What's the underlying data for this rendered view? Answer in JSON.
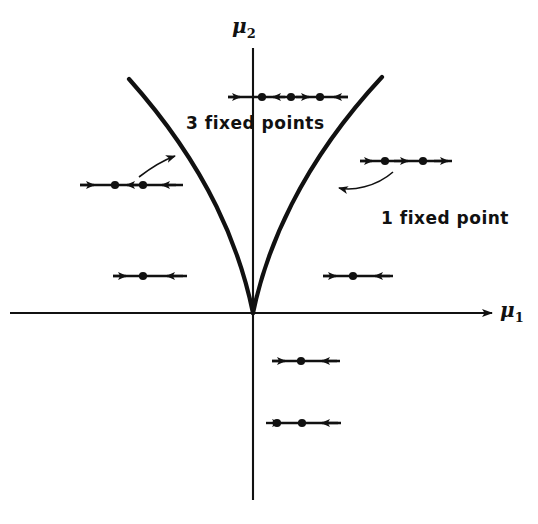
{
  "figure": {
    "background_color": "#ffffff",
    "ink_color": "#111111",
    "width": 538,
    "height": 524
  },
  "axes": {
    "origin": {
      "x": 253,
      "y": 313
    },
    "horizontal": {
      "name": "mu1-axis",
      "label": "μ",
      "subscript": "1",
      "x_start": 10,
      "x_end": 498,
      "y": 313,
      "arrow_end": "right"
    },
    "vertical": {
      "name": "mu2-axis",
      "label": "μ",
      "subscript": "2",
      "y_start": 48,
      "y_end": 500,
      "x": 253,
      "arrow_end": "none"
    }
  },
  "region_labels": [
    {
      "id": "three-fixed-points",
      "text": "3 fixed points",
      "x": 186,
      "y": 113
    },
    {
      "id": "one-fixed-point",
      "text": "1 fixed point",
      "x": 381,
      "y": 208
    }
  ],
  "cusp_curves": [
    {
      "id": "cusp-left-branch",
      "description": "Left branch of the cusp, tangent to the mu2 axis at the origin and rising to the upper left",
      "path": "M 253 313 C 240 250 210 170 129 79"
    },
    {
      "id": "cusp-right-branch",
      "description": "Right branch of the cusp, tangent to the mu2 axis at the origin and rising to the upper right",
      "path": "M 253 313 C 266 250 300 165 382 77"
    }
  ],
  "phase_lines": [
    {
      "id": "phase-line-top-three",
      "region": "inside cusp, three fixed points",
      "x_start": 228,
      "x_end": 348,
      "y": 97,
      "fixed_points": [
        262,
        291,
        320
      ],
      "flow_arrows": [
        {
          "x": 236,
          "direction": "right"
        },
        {
          "x": 277,
          "direction": "left"
        },
        {
          "x": 305,
          "direction": "right"
        },
        {
          "x": 338,
          "direction": "left"
        }
      ],
      "fixed_point_count": 3
    },
    {
      "id": "phase-line-left-three",
      "region": "inside cusp left, three fixed points",
      "x_start": 80,
      "x_end": 183,
      "y": 185,
      "fixed_points": [
        115,
        143
      ],
      "flow_arrows": [
        {
          "x": 92,
          "direction": "right"
        },
        {
          "x": 130,
          "direction": "left"
        },
        {
          "x": 164,
          "direction": "left"
        }
      ],
      "fixed_point_count": 2
    },
    {
      "id": "phase-line-right-one",
      "region": "outside cusp right, one fixed point",
      "x_start": 360,
      "x_end": 452,
      "y": 161,
      "fixed_points": [
        385,
        423
      ],
      "flow_arrows": [
        {
          "x": 368,
          "direction": "right"
        },
        {
          "x": 404,
          "direction": "right"
        },
        {
          "x": 444,
          "direction": "right"
        }
      ],
      "fixed_point_count": 2
    },
    {
      "id": "phase-line-left-one",
      "region": "outside cusp left, one fixed point",
      "x_start": 113,
      "x_end": 187,
      "y": 276,
      "fixed_points": [
        143
      ],
      "flow_arrows": [
        {
          "x": 122,
          "direction": "right"
        },
        {
          "x": 170,
          "direction": "left"
        }
      ],
      "fixed_point_count": 1
    },
    {
      "id": "phase-line-right-one-lower",
      "region": "outside cusp right lower, one fixed point",
      "x_start": 323,
      "x_end": 393,
      "y": 276,
      "fixed_points": [
        353
      ],
      "flow_arrows": [
        {
          "x": 332,
          "direction": "right"
        },
        {
          "x": 378,
          "direction": "left"
        }
      ],
      "fixed_point_count": 1
    },
    {
      "id": "phase-line-below-axis-upper",
      "region": "below mu1 axis, one fixed point",
      "x_start": 272,
      "x_end": 340,
      "y": 361,
      "fixed_points": [
        301
      ],
      "flow_arrows": [
        {
          "x": 281,
          "direction": "right"
        },
        {
          "x": 328,
          "direction": "left"
        }
      ],
      "fixed_point_count": 1
    },
    {
      "id": "phase-line-below-axis-lower",
      "region": "below mu1 axis lower, one fixed point",
      "x_start": 275,
      "x_end": 341,
      "y": 423,
      "fixed_points": [
        277,
        302
      ],
      "flow_arrows": [
        {
          "x": 330,
          "direction": "left"
        }
      ],
      "fixed_point_count": 2
    }
  ],
  "pointers": [
    {
      "id": "pointer-left",
      "description": "Curved arrow from left phase line to left cusp branch",
      "path": "M 143 178 C 155 168 166 161 177 157",
      "arrow_at": {
        "x": 179,
        "y": 156,
        "angle": -25
      }
    },
    {
      "id": "pointer-right",
      "description": "Curved arrow from right phase line to right cusp branch",
      "path": "M 391 173 C 375 186 352 190 336 188",
      "arrow_at": {
        "x": 334,
        "y": 188,
        "angle": 188
      }
    }
  ]
}
